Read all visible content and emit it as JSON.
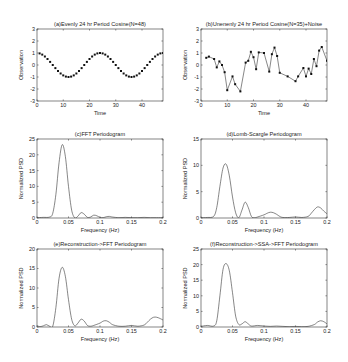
{
  "figure": {
    "width": 348,
    "height": 362
  },
  "chart_data": [
    {
      "id": "a",
      "type": "scatter",
      "title": "(a)Evenly 24 hr Period Cosine(N=48)",
      "xlabel": "Time",
      "ylabel": "Observation",
      "xlim": [
        0,
        48
      ],
      "ylim": [
        -3,
        3
      ],
      "xticks": [
        0,
        10,
        20,
        30,
        40
      ],
      "yticks": [
        -3,
        -2,
        -1,
        0,
        1,
        2,
        3
      ],
      "frame": {
        "x": 37,
        "y": 29,
        "w": 126,
        "h": 72
      },
      "style": "markers",
      "generator": "cosine",
      "series": [
        {
          "name": "cos(2*pi*t/24)",
          "x": [
            1,
            2,
            3,
            4,
            5,
            6,
            7,
            8,
            9,
            10,
            11,
            12,
            13,
            14,
            15,
            16,
            17,
            18,
            19,
            20,
            21,
            22,
            23,
            24,
            25,
            26,
            27,
            28,
            29,
            30,
            31,
            32,
            33,
            34,
            35,
            36,
            37,
            38,
            39,
            40,
            41,
            42,
            43,
            44,
            45,
            46,
            47,
            48
          ],
          "y": []
        }
      ]
    },
    {
      "id": "b",
      "type": "line",
      "title": "(b)Unenenly 24 hr Period Cosine(N=35)+Noise",
      "xlabel": "Time",
      "ylabel": "Observation",
      "xlim": [
        0,
        48
      ],
      "ylim": [
        -3,
        3
      ],
      "xticks": [
        0,
        10,
        20,
        30,
        40
      ],
      "yticks": [
        -3,
        -2,
        -1,
        0,
        1,
        2,
        3
      ],
      "frame": {
        "x": 201,
        "y": 29,
        "w": 126,
        "h": 72
      },
      "style": "line-markers",
      "series": [
        {
          "name": "noisy samples",
          "x": [
            2,
            3,
            5,
            6,
            7,
            8,
            9,
            10,
            12,
            13,
            15,
            17,
            18,
            19,
            20,
            21,
            22,
            24,
            26,
            27,
            28,
            29,
            30,
            33,
            36,
            37,
            39,
            40,
            41,
            42,
            43,
            44,
            45,
            46,
            48
          ],
          "y": [
            0.6,
            0.7,
            0.5,
            -0.2,
            0.3,
            0.0,
            -0.6,
            -2.1,
            -0.95,
            -1.6,
            -2.2,
            0.2,
            0.35,
            1.1,
            0.65,
            -0.35,
            1.05,
            1.0,
            -0.55,
            0.9,
            1.45,
            0.75,
            -0.65,
            -0.95,
            -1.35,
            -0.95,
            -0.25,
            -0.95,
            -0.3,
            -0.75,
            0.5,
            -0.1,
            1.2,
            1.5,
            0.35
          ]
        }
      ]
    },
    {
      "id": "c",
      "type": "line",
      "title": "(c)FFT Periodogram",
      "xlabel": "Frequency (Hz)",
      "ylabel": "Normalized PSD",
      "xlim": [
        0,
        0.2
      ],
      "ylim": [
        0,
        25
      ],
      "xticks": [
        0,
        0.05,
        0.1,
        0.15,
        0.2
      ],
      "yticks": [
        0,
        5,
        10,
        15,
        20,
        25
      ],
      "frame": {
        "x": 37,
        "y": 139,
        "w": 126,
        "h": 79
      },
      "style": "line",
      "series": [
        {
          "name": "PSD",
          "x": [
            0,
            0.01,
            0.02,
            0.025,
            0.03,
            0.035,
            0.04,
            0.045,
            0.05,
            0.055,
            0.06,
            0.065,
            0.07,
            0.075,
            0.08,
            0.085,
            0.09,
            0.095,
            0.1,
            0.105,
            0.11,
            0.115,
            0.12,
            0.13,
            0.14,
            0.15,
            0.16,
            0.17,
            0.18,
            0.19,
            0.2
          ],
          "y": [
            0.1,
            0.2,
            0.3,
            1.5,
            7.5,
            17.5,
            23.2,
            19.5,
            10.0,
            2.5,
            0.05,
            0.6,
            1.7,
            1.2,
            0.2,
            0.3,
            0.9,
            0.7,
            0.2,
            0.1,
            0.4,
            0.5,
            0.3,
            0.1,
            0.2,
            0.1,
            0.1,
            0.2,
            0.1,
            0.1,
            0.1
          ]
        }
      ]
    },
    {
      "id": "d",
      "type": "line",
      "title": "(d)Lomb-Scargle Periodogram",
      "xlabel": "Frequency (Hz)",
      "ylabel": "Normalized PSD",
      "xlim": [
        0,
        0.2
      ],
      "ylim": [
        0,
        15
      ],
      "xticks": [
        0,
        0.05,
        0.1,
        0.15,
        0.2
      ],
      "yticks": [
        0,
        5,
        10,
        15
      ],
      "frame": {
        "x": 201,
        "y": 139,
        "w": 126,
        "h": 79
      },
      "style": "line",
      "series": [
        {
          "name": "PSD",
          "x": [
            0,
            0.01,
            0.02,
            0.025,
            0.03,
            0.035,
            0.04,
            0.045,
            0.05,
            0.055,
            0.06,
            0.065,
            0.07,
            0.075,
            0.08,
            0.085,
            0.09,
            0.1,
            0.105,
            0.11,
            0.115,
            0.12,
            0.125,
            0.13,
            0.14,
            0.15,
            0.16,
            0.17,
            0.175,
            0.18,
            0.185,
            0.19,
            0.195,
            0.2
          ],
          "y": [
            0.05,
            0.1,
            0.3,
            2.0,
            6.0,
            9.5,
            10.2,
            8.0,
            4.0,
            1.0,
            0.05,
            1.5,
            3.0,
            2.0,
            0.3,
            0.05,
            0.2,
            0.6,
            0.9,
            1.1,
            1.0,
            0.7,
            0.3,
            0.1,
            0.1,
            0.2,
            0.1,
            0.3,
            0.9,
            1.6,
            2.1,
            1.9,
            1.3,
            0.8
          ]
        }
      ]
    },
    {
      "id": "e",
      "type": "line",
      "title": "(e)Reconstruction->FFT Periodogram",
      "xlabel": "Frequency (Hz)",
      "ylabel": "Normalized PSD",
      "xlim": [
        0,
        0.2
      ],
      "ylim": [
        0,
        20
      ],
      "xticks": [
        0,
        0.05,
        0.1,
        0.15,
        0.2
      ],
      "yticks": [
        0,
        5,
        10,
        15,
        20
      ],
      "frame": {
        "x": 37,
        "y": 249,
        "w": 126,
        "h": 78
      },
      "style": "line",
      "series": [
        {
          "name": "PSD",
          "x": [
            0,
            0.005,
            0.01,
            0.015,
            0.02,
            0.025,
            0.03,
            0.035,
            0.04,
            0.045,
            0.05,
            0.055,
            0.06,
            0.065,
            0.07,
            0.075,
            0.08,
            0.085,
            0.09,
            0.1,
            0.105,
            0.11,
            0.115,
            0.12,
            0.13,
            0.14,
            0.15,
            0.16,
            0.17,
            0.175,
            0.18,
            0.185,
            0.19,
            0.195,
            0.2
          ],
          "y": [
            0.3,
            0.1,
            0.3,
            0.6,
            0.2,
            0.2,
            5.0,
            12.5,
            15.3,
            13.0,
            7.0,
            2.0,
            0.3,
            1.0,
            2.0,
            1.5,
            0.4,
            0.2,
            0.4,
            1.0,
            1.5,
            1.6,
            1.2,
            0.6,
            0.2,
            0.2,
            0.4,
            0.2,
            0.5,
            1.2,
            2.0,
            2.5,
            2.5,
            2.2,
            1.8
          ]
        }
      ]
    },
    {
      "id": "f",
      "type": "line",
      "title": "(f)Reconstruction->SSA->FFT Periodogram",
      "xlabel": "Frequency (Hz)",
      "ylabel": "Normalized PSD",
      "xlim": [
        0,
        0.2
      ],
      "ylim": [
        0,
        25
      ],
      "xticks": [
        0,
        0.05,
        0.1,
        0.15,
        0.2
      ],
      "yticks": [
        0,
        5,
        10,
        15,
        20,
        25
      ],
      "frame": {
        "x": 201,
        "y": 249,
        "w": 126,
        "h": 78
      },
      "style": "line",
      "series": [
        {
          "name": "PSD",
          "x": [
            0,
            0.01,
            0.02,
            0.025,
            0.03,
            0.035,
            0.04,
            0.045,
            0.05,
            0.055,
            0.06,
            0.065,
            0.07,
            0.075,
            0.08,
            0.09,
            0.1,
            0.11,
            0.12,
            0.13,
            0.14,
            0.15,
            0.16,
            0.17,
            0.18,
            0.185,
            0.19,
            0.195,
            0.2
          ],
          "y": [
            0.2,
            0.5,
            0.3,
            2.0,
            10.0,
            18.5,
            20.3,
            18.0,
            11.0,
            3.5,
            0.8,
            1.0,
            1.7,
            1.0,
            0.3,
            0.5,
            0.3,
            0.2,
            0.3,
            0.2,
            0.1,
            0.2,
            0.1,
            0.2,
            0.8,
            1.6,
            2.0,
            1.7,
            1.0
          ]
        }
      ]
    }
  ]
}
